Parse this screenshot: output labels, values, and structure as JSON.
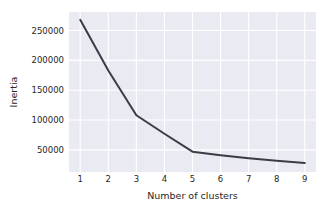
{
  "chart_data": {
    "type": "line",
    "title": "",
    "subtitle": "",
    "xlabel": "Number of clusters",
    "ylabel": "Inertia",
    "x": [
      1,
      2,
      3,
      4,
      5,
      6,
      7,
      8,
      9
    ],
    "values": [
      268000,
      183000,
      108000,
      77000,
      47000,
      41000,
      36000,
      32000,
      28000
    ],
    "series": [
      {
        "name": "Inertia",
        "values": [
          268000,
          183000,
          108000,
          77000,
          47000,
          41000,
          36000,
          32000,
          28000
        ]
      }
    ],
    "xtick_labels": [
      "1",
      "2",
      "3",
      "4",
      "5",
      "6",
      "7",
      "8",
      "9"
    ],
    "ytick_labels": [
      "50000",
      "100000",
      "150000",
      "200000",
      "250000"
    ],
    "ytick_values": [
      50000,
      100000,
      150000,
      200000,
      250000
    ],
    "xlim": [
      0.6,
      9.4
    ],
    "ylim": [
      13000,
      281000
    ],
    "grid": true,
    "legend": null,
    "annotations": [],
    "colors": {
      "line": "#3c3c46",
      "plot_background": "#eaeaf2",
      "gridline": "#ffffff",
      "figure_background": "#ffffff",
      "text": "#262626"
    },
    "line_width": 2
  }
}
